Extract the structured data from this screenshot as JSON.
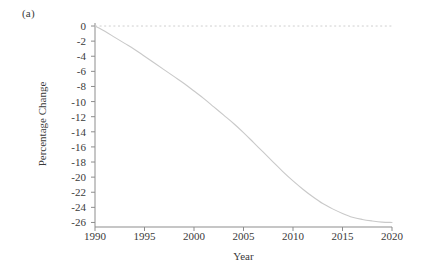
{
  "figure": {
    "panel_label": "(a)",
    "background": "#ffffff"
  },
  "chart_data": {
    "type": "line",
    "title": "",
    "subtitle": "",
    "panel": "(a)",
    "xlabel": "Year",
    "ylabel": "Percentage Change",
    "xlim": [
      1990,
      2020
    ],
    "ylim": [
      -26.6,
      0.4
    ],
    "grid": false,
    "legend": null,
    "line_color": "#c9c9c9",
    "line_width": 1.1,
    "xticks": [
      1990,
      1995,
      2000,
      2005,
      2010,
      2015,
      2020
    ],
    "xtick_labels": [
      "1990",
      "1995",
      "2000",
      "2005",
      "2010",
      "2015",
      "2020"
    ],
    "yticks": [
      0,
      -2,
      -4,
      -6,
      -8,
      -10,
      -12,
      -14,
      -16,
      -18,
      -20,
      -22,
      -24,
      -26
    ],
    "ytick_labels": [
      "0",
      "-2",
      "-4",
      "-6",
      "-8",
      "-10",
      "-12",
      "-14",
      "-16",
      "-18",
      "-20",
      "-22",
      "-24",
      "-26"
    ],
    "annotations": [
      {
        "name": "zero-reference-line",
        "type": "hline",
        "y": 0,
        "style": "dashed",
        "color": "#cfcfcf"
      }
    ],
    "series": [
      {
        "name": "percentage-change",
        "color": "#c9c9c9",
        "x": [
          1990,
          1991,
          1992,
          1993,
          1994,
          1995,
          1996,
          1997,
          1998,
          1999,
          2000,
          2001,
          2002,
          2003,
          2004,
          2005,
          2006,
          2007,
          2008,
          2009,
          2010,
          2011,
          2012,
          2013,
          2014,
          2015,
          2016,
          2017,
          2018,
          2019,
          2020
        ],
        "values": [
          0.0,
          -0.7,
          -1.5,
          -2.3,
          -3.1,
          -4.0,
          -4.9,
          -5.8,
          -6.7,
          -7.6,
          -8.6,
          -9.6,
          -10.7,
          -11.8,
          -12.9,
          -14.1,
          -15.4,
          -16.7,
          -18.0,
          -19.3,
          -20.5,
          -21.6,
          -22.6,
          -23.5,
          -24.2,
          -24.8,
          -25.3,
          -25.6,
          -25.8,
          -25.95,
          -26.0
        ]
      }
    ]
  }
}
